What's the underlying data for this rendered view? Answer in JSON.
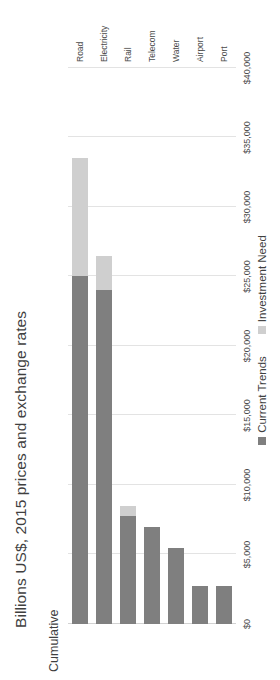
{
  "chart_data": {
    "type": "bar",
    "orientation": "horizontal-stacked",
    "title": "Billions US$, 2015 prices and exchange rates",
    "subtitle": "Cumulative",
    "xlabel": "",
    "ylabel": "",
    "categories": [
      "Road",
      "Electricity",
      "Rail",
      "Telecom",
      "Water",
      "Airport",
      "Port"
    ],
    "series": [
      {
        "name": "Current Trends",
        "color": "#7f7f7f",
        "values": [
          25000,
          24000,
          7800,
          7000,
          5500,
          2700,
          2700
        ]
      },
      {
        "name": "Investment Need",
        "color": "#cfcfcf",
        "values": [
          8500,
          2500,
          700,
          0,
          0,
          0,
          0
        ]
      }
    ],
    "totals": [
      33500,
      26500,
      8500,
      7000,
      5500,
      2700,
      2700
    ],
    "axis_ticks": [
      "$0",
      "$5,000",
      "$10,000",
      "$15,000",
      "$20,000",
      "$25,000",
      "$30,000",
      "$35,000",
      "$40,000"
    ],
    "axis_tick_values": [
      0,
      5000,
      10000,
      15000,
      20000,
      25000,
      30000,
      35000,
      40000
    ],
    "xlim": [
      0,
      40000
    ],
    "grid": true,
    "legend_position": "bottom",
    "legend": [
      "Current Trends",
      "Investment Need"
    ]
  },
  "colors": {
    "current_trends": "#7f7f7f",
    "investment_need": "#cfcfcf",
    "gridline": "#e3e3e3",
    "text": "#3f3f3f",
    "background": "#ffffff"
  }
}
